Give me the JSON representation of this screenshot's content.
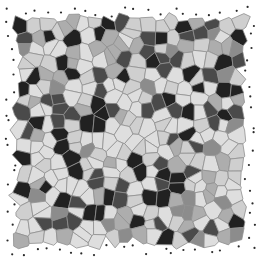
{
  "figure": {
    "kind": "voronoi-mosaic-pattern",
    "background": "#ffffff",
    "canvas": {
      "width": 260,
      "height": 270
    },
    "mosaic": {
      "grid": {
        "cols": 20,
        "rows": 20
      },
      "extent": {
        "x0": 10,
        "y0": 12,
        "x1": 250,
        "y1": 250
      },
      "jitter": 0.42,
      "seed": 1337,
      "cell_stroke": {
        "color": "#8f8f8f",
        "width": 0.8
      },
      "palette": [
        {
          "color": "#dedede",
          "weight": 0.3
        },
        {
          "color": "#cfcfcf",
          "weight": 0.17
        },
        {
          "color": "#adadad",
          "weight": 0.12
        },
        {
          "color": "#8c8c8c",
          "weight": 0.08
        },
        {
          "color": "#4a4a4a",
          "weight": 0.18
        },
        {
          "color": "#212121",
          "weight": 0.15
        }
      ],
      "boundary_dots": {
        "color": "#2a2a2a",
        "radius": 1.1
      }
    }
  }
}
